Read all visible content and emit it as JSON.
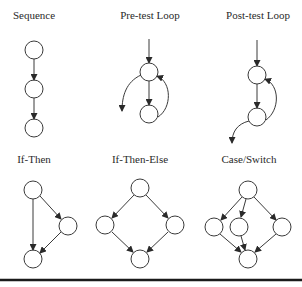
{
  "diagram": {
    "panels": [
      {
        "id": "sequence",
        "label": "Sequence"
      },
      {
        "id": "pre-test-loop",
        "label": "Pre-test Loop"
      },
      {
        "id": "post-test-loop",
        "label": "Post-test Loop"
      },
      {
        "id": "if-then",
        "label": "If-Then"
      },
      {
        "id": "if-then-else",
        "label": "If-Then-Else"
      },
      {
        "id": "case-switch",
        "label": "Case/Switch"
      }
    ],
    "colors": {
      "stroke": "#3a3a3a",
      "background": "#ffffff",
      "rule": "#1a1a1a"
    }
  }
}
